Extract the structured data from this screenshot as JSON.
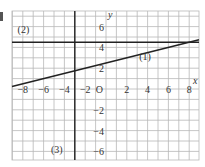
{
  "chart_data": {
    "type": "line",
    "title": "",
    "xlabel": "x",
    "ylabel": "y",
    "origin_label": "O",
    "xlim": [
      -9,
      9
    ],
    "ylim": [
      -6.8,
      7.5
    ],
    "grid": true,
    "grid_step": 1,
    "x_ticks": [
      -8,
      -6,
      -4,
      -2,
      2,
      4,
      6,
      8
    ],
    "x_tick_labels": [
      "−8",
      "−6",
      "−4",
      "−2",
      "2",
      "4",
      "6",
      "8"
    ],
    "y_ticks": [
      6,
      4,
      2,
      -2,
      -4,
      -6
    ],
    "y_tick_labels": [
      "6",
      "4",
      "2",
      "−2",
      "−4",
      "−6"
    ],
    "series": [
      {
        "name": "(1)",
        "kind": "slanted",
        "equation": "y = x/4 + 2.5",
        "slope": 0.25,
        "intercept": 2.5,
        "x": [
          -9,
          9
        ],
        "y": [
          0.25,
          4.75
        ],
        "label_pos": [
          3.2,
          2.8
        ]
      },
      {
        "name": "(2)",
        "kind": "horizontal",
        "equation": "y = 4.5",
        "y_value": 4.5,
        "x": [
          -9,
          9
        ],
        "y": [
          4.5,
          4.5
        ],
        "label_pos": [
          -8.5,
          5.4
        ]
      },
      {
        "name": "(3)",
        "kind": "vertical",
        "equation": "x = -3",
        "x_value": -3,
        "x": [
          -3,
          -3
        ],
        "y": [
          -6.8,
          7.5
        ],
        "label_pos": [
          -5.3,
          -6.2
        ]
      }
    ]
  },
  "colors": {
    "grid": "#b8b8b8",
    "line": "#222222",
    "text": "#333333",
    "background": "#ffffff"
  }
}
